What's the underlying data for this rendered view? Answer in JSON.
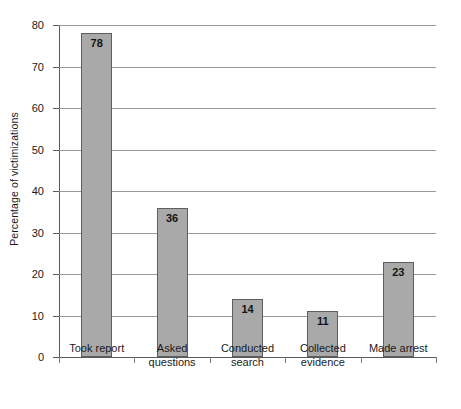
{
  "chart_data": {
    "type": "bar",
    "title": "",
    "xlabel": "",
    "ylabel": "Percentage of victimizations",
    "ylim": [
      0,
      80
    ],
    "ytick_step": 10,
    "grid": true,
    "legend": "none",
    "categories": [
      "Took report",
      "Asked questions",
      "Conducted search",
      "Collected evidence",
      "Made arrest"
    ],
    "category_lines": [
      [
        "Took report",
        ""
      ],
      [
        "Asked",
        "questions"
      ],
      [
        "Conducted",
        "search"
      ],
      [
        "Collected",
        "evidence"
      ],
      [
        "Made arrest",
        ""
      ]
    ],
    "values": [
      78,
      36,
      14,
      11,
      23
    ],
    "value_labels": [
      "78",
      "36",
      "14",
      "11",
      "23"
    ],
    "ytick_labels": [
      "0",
      "10",
      "20",
      "30",
      "40",
      "50",
      "60",
      "70",
      "80"
    ]
  },
  "style": {
    "bar_fill": "#a9a9a9",
    "bar_border": "#5e5e5e",
    "gridline_color": "#9a9a9a",
    "axis_color": "#5a5a5a",
    "text_color": "#1a1a1a",
    "background": "#ffffff"
  }
}
